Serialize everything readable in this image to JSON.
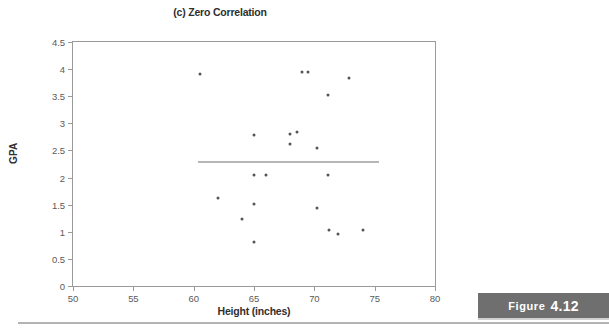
{
  "chart_data": {
    "type": "scatter",
    "title": "(c) Zero Correlation",
    "xlabel": "Height (inches)",
    "ylabel": "GPA",
    "xlim": [
      50,
      80
    ],
    "ylim": [
      0,
      4.5
    ],
    "xticks": [
      "50",
      "55",
      "60",
      "65",
      "70",
      "75",
      "80"
    ],
    "xtick_values": [
      50,
      55,
      60,
      65,
      70,
      75,
      80
    ],
    "yticks": [
      "0",
      "0.5",
      "1",
      "1.5",
      "2",
      "2.5",
      "3",
      "3.5",
      "4",
      "4.5"
    ],
    "ytick_values": [
      0,
      0.5,
      1,
      1.5,
      2,
      2.5,
      3,
      3.5,
      4,
      4.5
    ],
    "grid": false,
    "legend": false,
    "marker_color": "#555558",
    "points": [
      {
        "x": 60.5,
        "y": 3.91
      },
      {
        "x": 69.0,
        "y": 3.95
      },
      {
        "x": 69.5,
        "y": 3.95
      },
      {
        "x": 72.9,
        "y": 3.84
      },
      {
        "x": 71.1,
        "y": 3.53
      },
      {
        "x": 65.0,
        "y": 2.79
      },
      {
        "x": 68.0,
        "y": 2.8
      },
      {
        "x": 68.6,
        "y": 2.84
      },
      {
        "x": 68.0,
        "y": 2.61
      },
      {
        "x": 70.2,
        "y": 2.54
      },
      {
        "x": 65.0,
        "y": 2.04
      },
      {
        "x": 66.0,
        "y": 2.04
      },
      {
        "x": 71.1,
        "y": 2.04
      },
      {
        "x": 62.0,
        "y": 1.62
      },
      {
        "x": 65.0,
        "y": 1.52
      },
      {
        "x": 70.2,
        "y": 1.44
      },
      {
        "x": 64.0,
        "y": 1.24
      },
      {
        "x": 71.2,
        "y": 1.04
      },
      {
        "x": 74.0,
        "y": 1.04
      },
      {
        "x": 72.0,
        "y": 0.95
      },
      {
        "x": 65.0,
        "y": 0.82
      }
    ],
    "trend_line": {
      "y": 2.29,
      "x_start": 60.4,
      "x_end": 75.4,
      "color": "#6e6e72",
      "slope": 0
    }
  },
  "figure_caption": {
    "word": "Figure",
    "number": "4.12",
    "background": "#6f6f6f"
  }
}
